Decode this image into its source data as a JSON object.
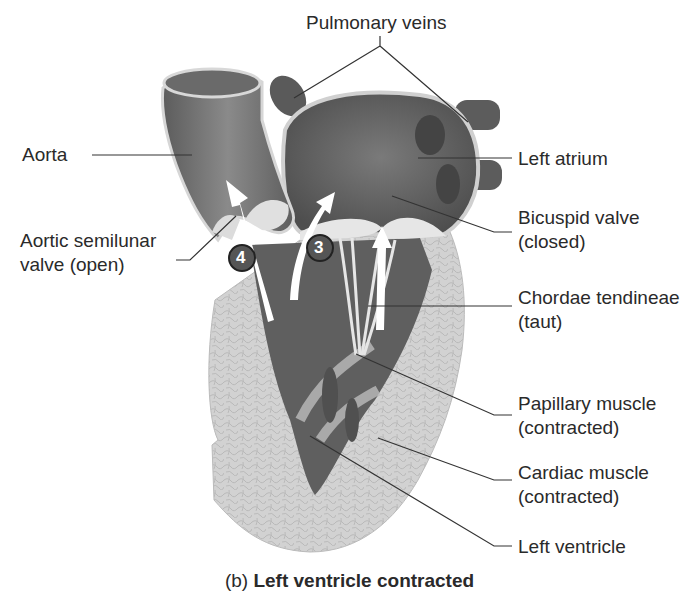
{
  "figure": {
    "caption": {
      "prefix": "(b)",
      "title": "Left ventricle contracted"
    }
  },
  "labels": {
    "pulmonary_veins": "Pulmonary veins",
    "aorta": "Aorta",
    "aortic_valve_l1": "Aortic semilunar",
    "aortic_valve_l2": "valve (open)",
    "left_atrium": "Left atrium",
    "bicuspid_l1": "Bicuspid valve",
    "bicuspid_l2": "(closed)",
    "chordae_l1": "Chordae tendineae",
    "chordae_l2": "(taut)",
    "papillary_l1": "Papillary muscle",
    "papillary_l2": "(contracted)",
    "cardiac_l1": "Cardiac muscle",
    "cardiac_l2": "(contracted)",
    "left_ventricle": "Left ventricle"
  },
  "step_markers": [
    {
      "number": "4",
      "meaning": "blood ejected through aortic valve"
    },
    {
      "number": "3",
      "meaning": "ventricle contracts"
    }
  ],
  "colors": {
    "chamber_dark": "#5a5a5a",
    "vessel": "#6e6e6e",
    "muscle_light": "#cfcfcf",
    "valve_light": "#e2e2e2",
    "leader_line": "#333333",
    "marker_fill": "#555555"
  }
}
